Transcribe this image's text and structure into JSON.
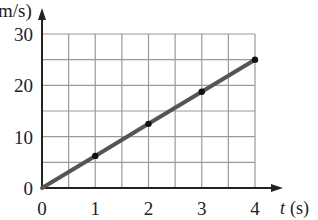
{
  "chart_data": {
    "type": "line",
    "title": "",
    "xlabel": "t (s)",
    "ylabel": "v (m/s)",
    "ylabel_visible": "m/s)",
    "x_var": "t",
    "x_unit": "(s)",
    "xlim": [
      0,
      4
    ],
    "ylim": [
      0,
      30
    ],
    "x_ticks": [
      0,
      1,
      2,
      3,
      4
    ],
    "y_ticks": [
      0,
      10,
      20,
      30
    ],
    "x_tick_labels": [
      "0",
      "1",
      "2",
      "3",
      "4"
    ],
    "y_tick_labels": [
      "0",
      "10",
      "20",
      "30"
    ],
    "grid": true,
    "grid_x_step": 0.5,
    "grid_y_step": 5,
    "legend": null,
    "series": [
      {
        "name": "velocity",
        "x": [
          0,
          1,
          2,
          3,
          4
        ],
        "values": [
          0,
          6.25,
          12.5,
          18.75,
          25
        ],
        "markers": [
          1,
          2,
          3,
          4
        ],
        "color": "#555555"
      }
    ]
  }
}
